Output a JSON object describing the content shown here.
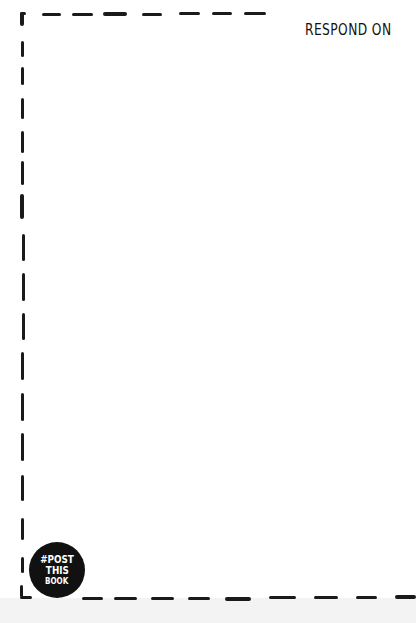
{
  "page": {
    "heading": "RESPOND ON",
    "badge": {
      "line1": "#POST",
      "line2": "THIS",
      "line3": "BOOK"
    },
    "frame": {
      "style": "hand-drawn dashed border",
      "color": "#1a1a1a"
    }
  }
}
